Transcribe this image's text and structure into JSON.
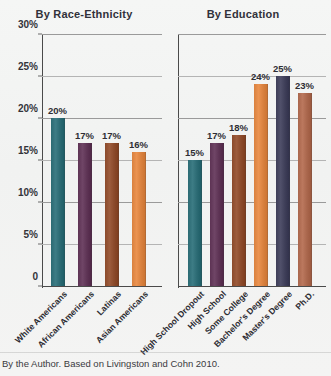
{
  "figure": {
    "caption": "By the Author. Based on Livingston and Cohn 2010.",
    "background_color": "#f4f5f4",
    "gridline_color": "#9a9a9a",
    "axis_color": "#4a4a4a"
  },
  "chart_data": [
    {
      "type": "bar",
      "title": "By Race-Ethnicity",
      "xlabel": "",
      "ylabel": "",
      "ylim": [
        0,
        30
      ],
      "grid": true,
      "legend": "none",
      "ytick_labels": [
        "0",
        "5%",
        "10%",
        "15%",
        "20%",
        "25%",
        "30%"
      ],
      "ytick_values": [
        0,
        5,
        10,
        15,
        20,
        25,
        30
      ],
      "categories": [
        "White Americans",
        "African Americans",
        "Latinas",
        "Asian Americans"
      ],
      "values": [
        20,
        17,
        17,
        16
      ],
      "value_labels": [
        "20%",
        "17%",
        "17%",
        "16%"
      ],
      "colors": [
        "#2b6a73",
        "#5d3354",
        "#8b4a2b",
        "#d9813f"
      ]
    },
    {
      "type": "bar",
      "title": "By Education",
      "xlabel": "",
      "ylabel": "",
      "ylim": [
        0,
        30
      ],
      "grid": true,
      "legend": "none",
      "ytick_labels": [
        "0",
        "5%",
        "10%",
        "15%",
        "20%",
        "25%",
        "30%"
      ],
      "ytick_values": [
        0,
        5,
        10,
        15,
        20,
        25,
        30
      ],
      "categories": [
        "High School Dropout",
        "High School",
        "Some College",
        "Bachelor's Degree",
        "Master's Degree",
        "Ph.D."
      ],
      "values": [
        15,
        17,
        18,
        24,
        25,
        23
      ],
      "value_labels": [
        "15%",
        "17%",
        "18%",
        "24%",
        "25%",
        "23%"
      ],
      "colors": [
        "#2b6a73",
        "#5d3354",
        "#8b4a2b",
        "#d9813f",
        "#3e3e58",
        "#a9664c"
      ]
    }
  ]
}
